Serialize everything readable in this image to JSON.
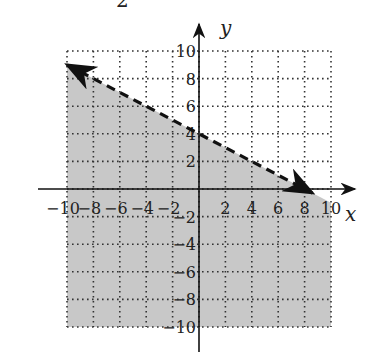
{
  "header_fragment": "2",
  "chart_data": {
    "type": "line",
    "title": "",
    "xlabel": "x",
    "ylabel": "y",
    "xlim": [
      -10,
      10
    ],
    "ylim": [
      -10,
      10
    ],
    "grid": true,
    "grid_style": "dotted",
    "x_ticks": [
      -10,
      -8,
      -6,
      -4,
      -2,
      2,
      4,
      6,
      8,
      10
    ],
    "y_ticks": [
      10,
      8,
      6,
      4,
      2,
      -2,
      -4,
      -6,
      -8,
      -10
    ],
    "x_tick_labels": [
      "-10",
      "-8",
      "-6",
      "-4",
      "-2",
      "2",
      "4",
      "6",
      "8",
      "10"
    ],
    "y_tick_labels": [
      "10",
      "8",
      "6",
      "4",
      "2",
      "-2",
      "-4",
      "-6",
      "-8",
      "-10"
    ],
    "series": [
      {
        "name": "boundary",
        "equation": "y = -x/2 + 4",
        "style": "dashed",
        "arrows": "both",
        "x": [
          -10,
          8.6
        ],
        "y": [
          9,
          -0.3
        ]
      }
    ],
    "shaded_region": {
      "description": "region below dashed line (y < -x/2 + 4)",
      "color": "#c8c8c8"
    },
    "line_color": "#111111",
    "grid_color": "#333333"
  }
}
